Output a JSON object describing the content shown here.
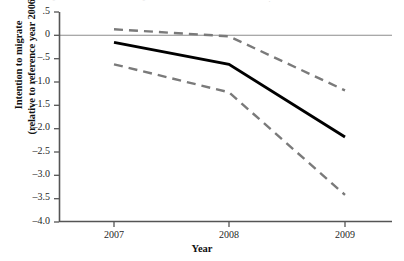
{
  "chart_data": {
    "type": "line",
    "title": "",
    "xlabel": "Year",
    "ylabel": "Intention to migrate (relative to reference year 2006)",
    "ylabel_line1": "Intention to migrate",
    "ylabel_line2": "(relative to reference year 2006)",
    "x": [
      2007,
      2008,
      2009
    ],
    "categories": [
      "2007",
      "2008",
      "2009"
    ],
    "xtick_labels": [
      "2007",
      "2008",
      "2009"
    ],
    "ytick_labels": [
      ".5",
      "0",
      "–.5",
      "–1.0",
      "–1.5",
      "–2.0",
      "–2.5",
      "–3.0",
      "–3.5",
      "–4.0"
    ],
    "ytick_values": [
      0.5,
      0,
      -0.5,
      -1.0,
      -1.5,
      -2.0,
      -2.5,
      -3.0,
      -3.5,
      -4.0
    ],
    "ylim": [
      -4.0,
      0.5
    ],
    "xlim": [
      2007,
      2009
    ],
    "grid": false,
    "legend": "none",
    "reference_line": {
      "y": 0,
      "color": "#8c8c8c",
      "style": "solid"
    },
    "series": [
      {
        "name": "Point estimate",
        "style": "solid",
        "color": "#000000",
        "width": 2.6,
        "values": [
          -0.15,
          -0.62,
          -2.18
        ]
      },
      {
        "name": "Upper 95% confidence limit",
        "style": "dashed",
        "color": "#7a7a7a",
        "width": 2.4,
        "values": [
          0.13,
          -0.02,
          -1.18
        ]
      },
      {
        "name": "Lower 95% confidence limit",
        "style": "dashed",
        "color": "#7a7a7a",
        "width": 2.4,
        "values": [
          -0.62,
          -1.22,
          -3.42
        ]
      }
    ],
    "annotations": []
  },
  "axes": {
    "y_axis_line_color": "#555555",
    "x_axis_line_color": "#555555"
  },
  "ghost_marks": {
    "left": "°",
    "mid": "°",
    "right": "·"
  }
}
